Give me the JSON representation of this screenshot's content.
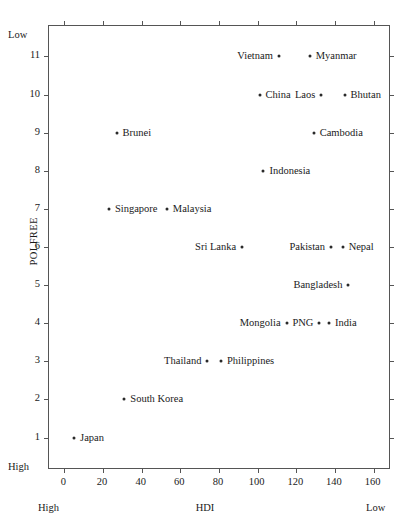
{
  "chart_data": {
    "type": "scatter",
    "title": "",
    "xlabel": "HDI",
    "ylabel": "POLFREE",
    "xlim": [
      -8,
      168
    ],
    "ylim": [
      0.2,
      11.8
    ],
    "grid": false,
    "legend": null,
    "xticks": [
      0,
      20,
      40,
      60,
      80,
      100,
      120,
      140,
      160
    ],
    "yticks": [
      1,
      2,
      3,
      4,
      5,
      6,
      7,
      8,
      9,
      10,
      11
    ],
    "axis_annotations": {
      "y_top": "Low",
      "y_bottom": "High",
      "x_left": "High",
      "x_right": "Low"
    },
    "points": [
      {
        "label": "Myanmar",
        "x": 127,
        "y": 11,
        "label_side": "right"
      },
      {
        "label": "Vietnam",
        "x": 111,
        "y": 11,
        "label_side": "left"
      },
      {
        "label": "China",
        "x": 101,
        "y": 10,
        "label_side": "right"
      },
      {
        "label": "Laos",
        "x": 133,
        "y": 10,
        "label_side": "left"
      },
      {
        "label": "Bhutan",
        "x": 145,
        "y": 10,
        "label_side": "right"
      },
      {
        "label": "Brunei",
        "x": 27,
        "y": 9,
        "label_side": "right"
      },
      {
        "label": "Cambodia",
        "x": 129,
        "y": 9,
        "label_side": "right"
      },
      {
        "label": "Indonesia",
        "x": 103,
        "y": 8,
        "label_side": "right"
      },
      {
        "label": "Singapore",
        "x": 23,
        "y": 7,
        "label_side": "right"
      },
      {
        "label": "Malaysia",
        "x": 53,
        "y": 7,
        "label_side": "right"
      },
      {
        "label": "Sri Lanka",
        "x": 92,
        "y": 6,
        "label_side": "left"
      },
      {
        "label": "Pakistan",
        "x": 138,
        "y": 6,
        "label_side": "left"
      },
      {
        "label": "Nepal",
        "x": 144,
        "y": 6,
        "label_side": "right"
      },
      {
        "label": "Bangladesh",
        "x": 147,
        "y": 5,
        "label_side": "left"
      },
      {
        "label": "Mongolia",
        "x": 115,
        "y": 4,
        "label_side": "left"
      },
      {
        "label": "PNG",
        "x": 132,
        "y": 4,
        "label_side": "left"
      },
      {
        "label": "India",
        "x": 137,
        "y": 4,
        "label_side": "right"
      },
      {
        "label": "Thailand",
        "x": 74,
        "y": 3,
        "label_side": "left"
      },
      {
        "label": "Philippines",
        "x": 81,
        "y": 3,
        "label_side": "right"
      },
      {
        "label": "South Korea",
        "x": 31,
        "y": 2,
        "label_side": "right"
      },
      {
        "label": "Japan",
        "x": 5,
        "y": 1,
        "label_side": "right"
      }
    ]
  }
}
